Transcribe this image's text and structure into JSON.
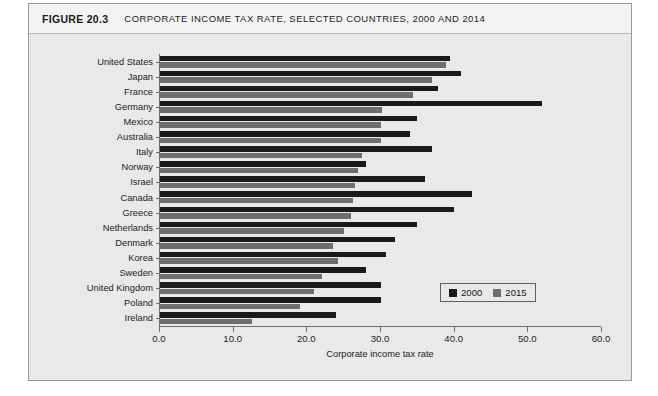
{
  "figure": {
    "number": "FIGURE 20.3",
    "title": "CORPORATE INCOME TAX RATE, SELECTED COUNTRIES, 2000 AND 2014"
  },
  "legend": {
    "position": "inside-bottom-right",
    "items": [
      {
        "label": "2000",
        "color": "#1a1a1a",
        "swatch_name": "legend-swatch-2000"
      },
      {
        "label": "2015",
        "color": "#6e6e6e",
        "swatch_name": "legend-swatch-2015"
      }
    ]
  },
  "axis": {
    "x_title": "Corporate income tax rate",
    "x_ticks": [
      "0.0",
      "10.0",
      "20.0",
      "30.0",
      "40.0",
      "50.0",
      "60.0"
    ]
  },
  "chart_data": {
    "type": "bar",
    "orientation": "horizontal",
    "title": "CORPORATE INCOME TAX RATE, SELECTED COUNTRIES, 2000 AND 2014",
    "xlabel": "Corporate income tax rate",
    "ylabel": "",
    "xlim": [
      0.0,
      60.0
    ],
    "xticks": [
      0.0,
      10.0,
      20.0,
      30.0,
      40.0,
      50.0,
      60.0
    ],
    "grid": false,
    "legend": [
      "2000",
      "2015"
    ],
    "legend_position": "inside-bottom-right",
    "categories": [
      "United States",
      "Japan",
      "France",
      "Germany",
      "Mexico",
      "Australia",
      "Italy",
      "Norway",
      "Israel",
      "Canada",
      "Greece",
      "Netherlands",
      "Denmark",
      "Korea",
      "Sweden",
      "United Kingdom",
      "Poland",
      "Ireland"
    ],
    "series": [
      {
        "name": "2000",
        "color": "#1a1a1a",
        "values": [
          39.4,
          40.9,
          37.8,
          52.0,
          35.0,
          34.0,
          37.0,
          28.0,
          36.0,
          42.4,
          40.0,
          35.0,
          32.0,
          30.8,
          28.0,
          30.0,
          30.0,
          24.0
        ]
      },
      {
        "name": "2015",
        "color": "#6e6e6e",
        "values": [
          38.9,
          37.0,
          34.4,
          30.2,
          30.0,
          30.0,
          27.5,
          27.0,
          26.5,
          26.3,
          26.0,
          25.0,
          23.5,
          24.2,
          22.0,
          21.0,
          19.0,
          12.5
        ]
      }
    ]
  }
}
